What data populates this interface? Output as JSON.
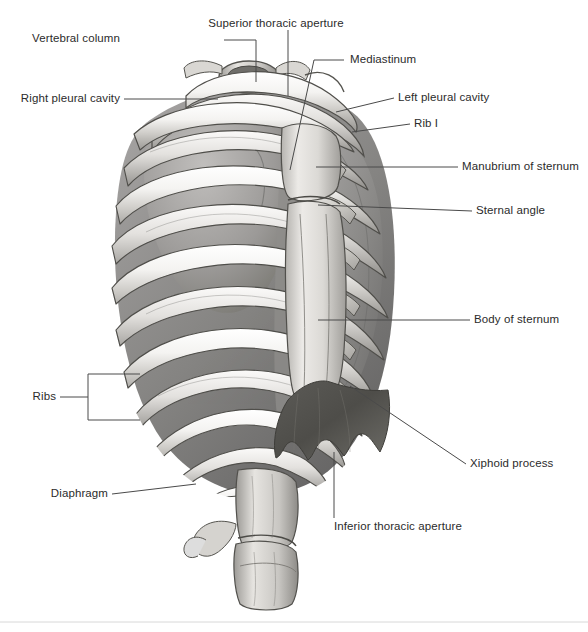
{
  "figure": {
    "style": "grayscale-medical-illustration",
    "background_color": "#ffffff",
    "text_color": "#2b2b2b",
    "leader_color": "#4a4a4a",
    "bone_light": "#f2f1ef",
    "bone_mid": "#c9c7c4",
    "bone_shadow": "#8e8c89",
    "cavity_dark": "#6b6a68",
    "diaphragm_dark": "#55544f"
  },
  "labels": [
    {
      "id": "vertebral-column",
      "text": "Vertebral column",
      "align": "right"
    },
    {
      "id": "superior-thoracic-aperture",
      "text": "Superior thoracic aperture",
      "align": "left"
    },
    {
      "id": "mediastinum",
      "text": "Mediastinum",
      "align": "left"
    },
    {
      "id": "right-pleural-cavity",
      "text": "Right pleural cavity",
      "align": "right"
    },
    {
      "id": "left-pleural-cavity",
      "text": "Left pleural cavity",
      "align": "left"
    },
    {
      "id": "rib-i",
      "text": "Rib I",
      "align": "left"
    },
    {
      "id": "manubrium-of-sternum",
      "text": "Manubrium of sternum",
      "align": "left"
    },
    {
      "id": "sternal-angle",
      "text": "Sternal angle",
      "align": "left"
    },
    {
      "id": "body-of-sternum",
      "text": "Body of sternum",
      "align": "left"
    },
    {
      "id": "ribs",
      "text": "Ribs",
      "align": "right"
    },
    {
      "id": "diaphragm",
      "text": "Diaphragm",
      "align": "right"
    },
    {
      "id": "xiphoid-process",
      "text": "Xiphoid process",
      "align": "left"
    },
    {
      "id": "inferior-thoracic-aperture",
      "text": "Inferior thoracic aperture",
      "align": "left"
    }
  ]
}
